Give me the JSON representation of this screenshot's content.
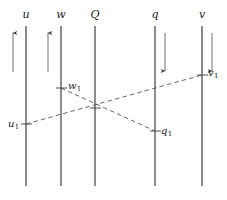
{
  "figure": {
    "background_color": "#ffffff",
    "line_color": "#3a3a3a",
    "dash_color": "#555555",
    "width": 227,
    "height": 200
  },
  "worldlines": [
    {
      "label": "u",
      "x": 26,
      "top": 26,
      "bottom": 186,
      "label_x": 26,
      "label_y": 9
    },
    {
      "label": "w",
      "x": 61,
      "top": 26,
      "bottom": 186,
      "label_x": 61,
      "label_y": 9
    },
    {
      "label": "Q",
      "x": 95,
      "top": 26,
      "bottom": 186,
      "label_x": 95,
      "label_y": 9
    },
    {
      "label": "q",
      "x": 155,
      "top": 26,
      "bottom": 186,
      "label_x": 155,
      "label_y": 9
    },
    {
      "label": "v",
      "x": 202,
      "top": 26,
      "bottom": 186,
      "label_x": 202,
      "label_y": 9
    }
  ],
  "direction_arrows": [
    {
      "name": "arrow-u-up",
      "x": 13,
      "y_start": 72,
      "y_end": 33,
      "direction": "up"
    },
    {
      "name": "arrow-w-up",
      "x": 48,
      "y_start": 72,
      "y_end": 33,
      "direction": "up"
    },
    {
      "name": "arrow-q-down",
      "x": 165,
      "y_start": 33,
      "y_end": 71,
      "direction": "down"
    },
    {
      "name": "arrow-v-down",
      "x": 212,
      "y_start": 33,
      "y_end": 71,
      "direction": "down"
    }
  ],
  "dashed_paths": [
    {
      "name": "path-u1-v1",
      "from": "u1",
      "to": "v1",
      "x1": 26,
      "y1": 124,
      "x2": 202,
      "y2": 75
    },
    {
      "name": "path-w1-q1",
      "from": "w1",
      "to": "q1",
      "x1": 61,
      "y1": 88,
      "x2": 155,
      "y2": 131
    }
  ],
  "event_points": [
    {
      "id": "u1",
      "base": "u",
      "sub": "1",
      "x": 26,
      "y": 124,
      "label_x": 8,
      "label_y": 119,
      "align": "left"
    },
    {
      "id": "w1",
      "base": "w",
      "sub": "1",
      "x": 61,
      "y": 88,
      "label_x": 68,
      "label_y": 81,
      "align": "right"
    },
    {
      "id": "q1",
      "base": "q",
      "sub": "1",
      "x": 155,
      "y": 131,
      "label_x": 161,
      "label_y": 126,
      "align": "right"
    },
    {
      "id": "v1",
      "base": "v",
      "sub": "1",
      "x": 202,
      "y": 75,
      "label_x": 208,
      "label_y": 68,
      "align": "right"
    }
  ],
  "crossing_point": {
    "name": "crossing-Q",
    "x": 95,
    "y": 108
  },
  "tick_marks": [
    {
      "name": "tick-u1",
      "x": 26,
      "y": 124
    },
    {
      "name": "tick-w1",
      "x": 61,
      "y": 88
    },
    {
      "name": "tick-q1",
      "x": 155,
      "y": 131
    },
    {
      "name": "tick-v1",
      "x": 202,
      "y": 75
    },
    {
      "name": "tick-crossing",
      "x": 95,
      "y": 108
    }
  ]
}
